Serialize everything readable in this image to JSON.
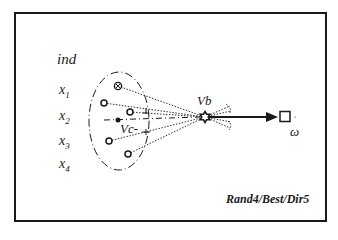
{
  "diagram": {
    "type": "mutation-strategy-schematic",
    "row_header": "ind",
    "rows": [
      {
        "name": "x",
        "sub": "1"
      },
      {
        "name": "x",
        "sub": "2"
      },
      {
        "name": "x",
        "sub": "3"
      },
      {
        "name": "x",
        "sub": "4"
      }
    ],
    "labels": {
      "best_vector": "Vb",
      "centroid": "Vc-",
      "target": "ω"
    },
    "caption": "Rand4/Best/Dir5",
    "colors": {
      "stroke": "#1a1a1a",
      "background": "#ffffff"
    }
  }
}
